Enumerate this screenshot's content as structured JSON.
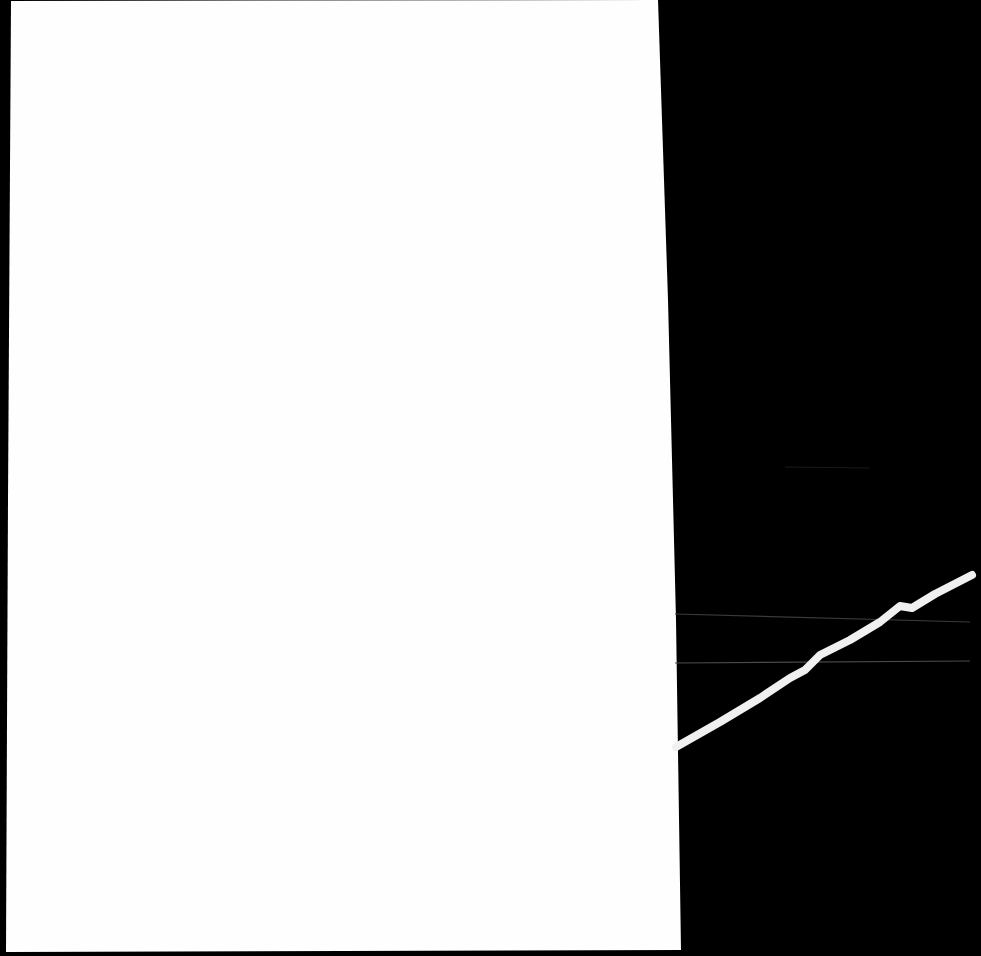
{
  "scene": {
    "description": "White sheet of paper on a black background with a thin white wire crossing diagonally at right",
    "colors": {
      "background": "#000000",
      "paper": "#fefefe",
      "wire": "#f0f0f0",
      "faint_lines": "#3a3a3a"
    }
  }
}
